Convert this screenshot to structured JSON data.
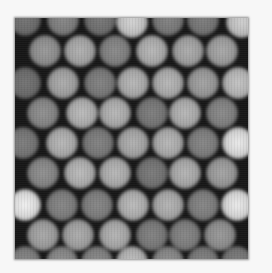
{
  "image": {
    "description": "Grayscale micrograph of hexagonally close-packed spherical particles",
    "frame": {
      "left": 15,
      "top": 18,
      "width": 233,
      "height": 241
    },
    "background_color": "#f7f7f7",
    "interstitial_color": "#161616"
  },
  "spheres": [
    {
      "x": 25,
      "y": 20,
      "b": 0.3
    },
    {
      "x": 63,
      "y": 20,
      "b": 0.4
    },
    {
      "x": 100,
      "y": 20,
      "b": 0.32
    },
    {
      "x": 132,
      "y": 22,
      "b": 0.8
    },
    {
      "x": 168,
      "y": 20,
      "b": 0.38
    },
    {
      "x": 203,
      "y": 20,
      "b": 0.35
    },
    {
      "x": 242,
      "y": 22,
      "b": 0.78
    },
    {
      "x": 45,
      "y": 51,
      "b": 0.5
    },
    {
      "x": 80,
      "y": 51,
      "b": 0.62
    },
    {
      "x": 115,
      "y": 51,
      "b": 0.42
    },
    {
      "x": 152,
      "y": 51,
      "b": 0.66
    },
    {
      "x": 188,
      "y": 51,
      "b": 0.6
    },
    {
      "x": 222,
      "y": 51,
      "b": 0.58
    },
    {
      "x": 25,
      "y": 83,
      "b": 0.3
    },
    {
      "x": 63,
      "y": 83,
      "b": 0.6
    },
    {
      "x": 100,
      "y": 83,
      "b": 0.38
    },
    {
      "x": 133,
      "y": 83,
      "b": 0.66
    },
    {
      "x": 168,
      "y": 83,
      "b": 0.66
    },
    {
      "x": 203,
      "y": 83,
      "b": 0.55
    },
    {
      "x": 238,
      "y": 83,
      "b": 0.72
    },
    {
      "x": 43,
      "y": 113,
      "b": 0.45
    },
    {
      "x": 82,
      "y": 113,
      "b": 0.68
    },
    {
      "x": 115,
      "y": 113,
      "b": 0.66
    },
    {
      "x": 152,
      "y": 113,
      "b": 0.36
    },
    {
      "x": 185,
      "y": 113,
      "b": 0.66
    },
    {
      "x": 222,
      "y": 113,
      "b": 0.42
    },
    {
      "x": 23,
      "y": 143,
      "b": 0.35
    },
    {
      "x": 62,
      "y": 143,
      "b": 0.66
    },
    {
      "x": 98,
      "y": 143,
      "b": 0.38
    },
    {
      "x": 133,
      "y": 143,
      "b": 0.62
    },
    {
      "x": 168,
      "y": 143,
      "b": 0.66
    },
    {
      "x": 203,
      "y": 143,
      "b": 0.4
    },
    {
      "x": 238,
      "y": 143,
      "b": 0.92
    },
    {
      "x": 43,
      "y": 173,
      "b": 0.45
    },
    {
      "x": 80,
      "y": 173,
      "b": 0.68
    },
    {
      "x": 115,
      "y": 173,
      "b": 0.66
    },
    {
      "x": 152,
      "y": 173,
      "b": 0.34
    },
    {
      "x": 185,
      "y": 173,
      "b": 0.64
    },
    {
      "x": 222,
      "y": 173,
      "b": 0.56
    },
    {
      "x": 25,
      "y": 205,
      "b": 0.95
    },
    {
      "x": 62,
      "y": 205,
      "b": 0.4
    },
    {
      "x": 97,
      "y": 205,
      "b": 0.4
    },
    {
      "x": 133,
      "y": 205,
      "b": 0.68
    },
    {
      "x": 168,
      "y": 205,
      "b": 0.64
    },
    {
      "x": 203,
      "y": 205,
      "b": 0.4
    },
    {
      "x": 237,
      "y": 205,
      "b": 0.92
    },
    {
      "x": 43,
      "y": 235,
      "b": 0.58
    },
    {
      "x": 78,
      "y": 235,
      "b": 0.6
    },
    {
      "x": 115,
      "y": 235,
      "b": 0.64
    },
    {
      "x": 152,
      "y": 235,
      "b": 0.38
    },
    {
      "x": 185,
      "y": 235,
      "b": 0.4
    },
    {
      "x": 220,
      "y": 235,
      "b": 0.5
    },
    {
      "x": 25,
      "y": 262,
      "b": 0.4
    },
    {
      "x": 62,
      "y": 262,
      "b": 0.45
    },
    {
      "x": 97,
      "y": 262,
      "b": 0.42
    },
    {
      "x": 132,
      "y": 262,
      "b": 0.7
    },
    {
      "x": 168,
      "y": 262,
      "b": 0.45
    },
    {
      "x": 203,
      "y": 262,
      "b": 0.38
    },
    {
      "x": 237,
      "y": 262,
      "b": 0.35
    }
  ]
}
